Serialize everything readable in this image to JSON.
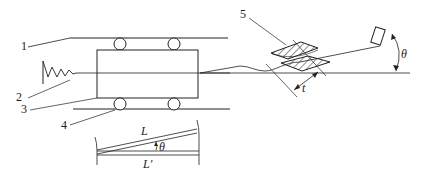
{
  "diagram": {
    "type": "mechanical schematic",
    "labels": {
      "part1": "1",
      "part2": "2",
      "part3": "3",
      "part4": "4",
      "part5": "5",
      "thickness": "t",
      "angle": "θ",
      "length_L": "L",
      "length_L_prime": "L'",
      "inset_angle": "θ"
    },
    "colors": {
      "stroke": "#222222",
      "background": "#ffffff"
    }
  }
}
